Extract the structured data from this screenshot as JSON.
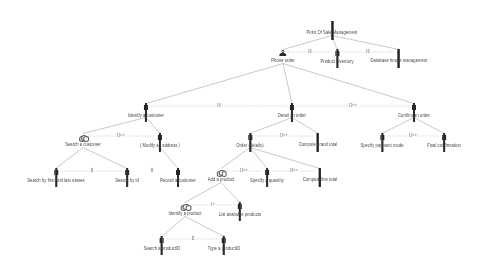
{
  "diagram": {
    "type": "task-tree",
    "colors": {
      "line": "#9a9a9a",
      "text": "#3a3a3a",
      "operator": "#555555",
      "icon_dark": "#242424",
      "icon_grey": "#b9b9b9",
      "background": "#ffffff"
    },
    "nodes": [
      {
        "id": "root",
        "label": "Point Of Sale Management",
        "icon": "application-icon",
        "x": 332,
        "y": 22,
        "level": 0
      },
      {
        "id": "phone",
        "label": "Phone order",
        "icon": "user-icon",
        "x": 283,
        "y": 50,
        "level": 1
      },
      {
        "id": "inventory",
        "label": "Product inventory",
        "icon": "form-icon",
        "x": 337,
        "y": 50,
        "level": 1
      },
      {
        "id": "warehouse",
        "label": "Database house management",
        "icon": "application-icon",
        "x": 399,
        "y": 50,
        "level": 1
      },
      {
        "id": "identcust",
        "label": "Identify a customer",
        "icon": "form-icon",
        "x": 146,
        "y": 104,
        "level": 2
      },
      {
        "id": "detailorder",
        "label": "Detail an order",
        "icon": "form-icon",
        "x": 292,
        "y": 104,
        "level": 2
      },
      {
        "id": "confirm",
        "label": "Confirm an order",
        "icon": "form-icon",
        "x": 414,
        "y": 104,
        "level": 2
      },
      {
        "id": "searchcust",
        "label": "Search a customer",
        "icon": "cloud-icon",
        "x": 83,
        "y": 134,
        "level": 3
      },
      {
        "id": "modaddr",
        "label": "( Modify an address )",
        "icon": "form-icon",
        "x": 160,
        "y": 134,
        "level": 3
      },
      {
        "id": "orderdet",
        "label": "Order (details)",
        "icon": "form-icon",
        "x": 250,
        "y": 134,
        "level": 3
      },
      {
        "id": "grandtotal",
        "label": "Compute grand total",
        "icon": "application-icon",
        "x": 318,
        "y": 134,
        "level": 3
      },
      {
        "id": "paymode",
        "label": "Specify payment mode",
        "icon": "form-icon",
        "x": 382,
        "y": 134,
        "level": 3
      },
      {
        "id": "finalconf",
        "label": "Final confirmation",
        "icon": "form-icon",
        "x": 444,
        "y": 134,
        "level": 3
      },
      {
        "id": "searchname",
        "label": "Search by first and last names",
        "icon": "form-icon",
        "x": 56,
        "y": 169,
        "level": 4
      },
      {
        "id": "searchid",
        "label": "Search by id",
        "icon": "form-icon",
        "x": 127,
        "y": 169,
        "level": 4
      },
      {
        "id": "reccust",
        "label": "Record a customer",
        "icon": "form-icon",
        "x": 178,
        "y": 169,
        "level": 4
      },
      {
        "id": "addprod",
        "label": "Add a product",
        "icon": "cloud-icon",
        "x": 221,
        "y": 169,
        "level": 4
      },
      {
        "id": "specqty",
        "label": "Specify a quantity",
        "icon": "form-icon",
        "x": 267,
        "y": 169,
        "level": 4
      },
      {
        "id": "linetotal",
        "label": "Compute line total",
        "icon": "application-icon",
        "x": 320,
        "y": 169,
        "level": 4
      },
      {
        "id": "identprod",
        "label": "Identify a product",
        "icon": "cloud-icon",
        "x": 185,
        "y": 203,
        "level": 5
      },
      {
        "id": "listprod",
        "label": "List available products",
        "icon": "form-icon",
        "x": 240,
        "y": 203,
        "level": 5
      },
      {
        "id": "searchpid",
        "label": "Search a productID",
        "icon": "form-icon",
        "x": 162,
        "y": 237,
        "level": 6
      },
      {
        "id": "typepid",
        "label": "Type a productID",
        "icon": "form-icon",
        "x": 224,
        "y": 237,
        "level": 6
      }
    ],
    "parent_edges": [
      {
        "from": "root",
        "to": "phone"
      },
      {
        "from": "root",
        "to": "inventory"
      },
      {
        "from": "root",
        "to": "warehouse"
      },
      {
        "from": "phone",
        "to": "identcust"
      },
      {
        "from": "phone",
        "to": "detailorder"
      },
      {
        "from": "phone",
        "to": "confirm"
      },
      {
        "from": "identcust",
        "to": "searchcust"
      },
      {
        "from": "identcust",
        "to": "modaddr"
      },
      {
        "from": "detailorder",
        "to": "orderdet"
      },
      {
        "from": "detailorder",
        "to": "grandtotal"
      },
      {
        "from": "confirm",
        "to": "paymode"
      },
      {
        "from": "confirm",
        "to": "finalconf"
      },
      {
        "from": "searchcust",
        "to": "searchname"
      },
      {
        "from": "searchcust",
        "to": "searchid"
      },
      {
        "from": "modaddr",
        "to": "reccust"
      },
      {
        "from": "orderdet",
        "to": "addprod"
      },
      {
        "from": "orderdet",
        "to": "specqty"
      },
      {
        "from": "orderdet",
        "to": "linetotal"
      },
      {
        "from": "addprod",
        "to": "identprod"
      },
      {
        "from": "addprod",
        "to": "listprod"
      },
      {
        "from": "identprod",
        "to": "searchpid"
      },
      {
        "from": "identprod",
        "to": "typepid"
      }
    ],
    "sibling_operators": [
      {
        "id": "op-phone-inventory",
        "label": "|||",
        "x": 310,
        "y": 50
      },
      {
        "id": "op-inventory-warehouse",
        "label": "|||",
        "x": 368,
        "y": 50
      },
      {
        "id": "op-ident-detail",
        "label": "|||",
        "x": 219,
        "y": 104
      },
      {
        "id": "op-detail-confirm",
        "label": "[]>>",
        "x": 353,
        "y": 104
      },
      {
        "id": "op-search-modaddr",
        "label": "[]>>",
        "x": 121,
        "y": 134
      },
      {
        "id": "op-orderdet-total",
        "label": "[]>>",
        "x": 284,
        "y": 134
      },
      {
        "id": "op-paymode-final",
        "label": "[]>>",
        "x": 413,
        "y": 134
      },
      {
        "id": "op-name-id",
        "label": "[]",
        "x": 92,
        "y": 169
      },
      {
        "id": "op-id-record",
        "label": "[]",
        "x": 152,
        "y": 169
      },
      {
        "id": "op-add-qty",
        "label": "[]>>",
        "x": 244,
        "y": 169
      },
      {
        "id": "op-qty-line",
        "label": "[]>>",
        "x": 294,
        "y": 169
      },
      {
        "id": "op-ident-list",
        "label": "|>",
        "x": 213,
        "y": 203
      },
      {
        "id": "op-spid-tpid",
        "label": "[]",
        "x": 193,
        "y": 237
      }
    ]
  }
}
